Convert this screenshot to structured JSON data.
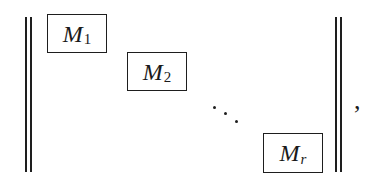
{
  "expression": {
    "description": "Block diagonal matrix with norm bars",
    "delimiter": "double-vertical-bar",
    "blocks": [
      {
        "symbol": "M",
        "subscript": "1"
      },
      {
        "symbol": "M",
        "subscript": "2"
      },
      {
        "symbol": "M",
        "subscript": "r"
      }
    ],
    "ellipsis": "diagonal-dots",
    "trailing_punctuation": ","
  }
}
